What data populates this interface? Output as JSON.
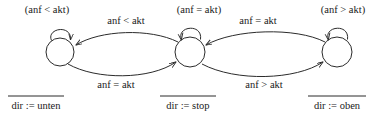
{
  "diagram": {
    "type": "state-machine",
    "title": "",
    "states": [
      {
        "id": "state-left",
        "guard_label": "(anf < akt)",
        "output_label": "dir := unten",
        "cx": 60,
        "cy": 52,
        "r": 14
      },
      {
        "id": "state-center",
        "guard_label": "(anf = akt)",
        "output_label": "dir := stop",
        "cx": 190,
        "cy": 52,
        "r": 15
      },
      {
        "id": "state-right",
        "guard_label": "(anf > akt)",
        "output_label": "dir := oben",
        "cx": 337,
        "cy": 52,
        "r": 15
      }
    ],
    "self_loops": [
      {
        "id": "self-loop-left",
        "state": "state-left"
      },
      {
        "id": "self-loop-center",
        "state": "state-center"
      },
      {
        "id": "self-loop-right",
        "state": "state-right"
      }
    ],
    "transitions": [
      {
        "id": "transition-center-to-left",
        "label": "anf < akt",
        "from": "state-center",
        "to": "state-left",
        "label_x": 126,
        "label_y": 21
      },
      {
        "id": "transition-right-to-center",
        "label": "anf = akt",
        "from": "state-right",
        "to": "state-center",
        "label_x": 258,
        "label_y": 21
      },
      {
        "id": "transition-left-to-center",
        "label": "anf = akt",
        "from": "state-left",
        "to": "state-center",
        "label_x": 116,
        "label_y": 85
      },
      {
        "id": "transition-center-to-right",
        "label": "anf > akt",
        "from": "state-center",
        "to": "state-right",
        "label_x": 264,
        "label_y": 85
      }
    ],
    "colors": {
      "stroke": "#2b2b2b",
      "text": "#1a1a1a",
      "background": "#ffffff"
    }
  }
}
